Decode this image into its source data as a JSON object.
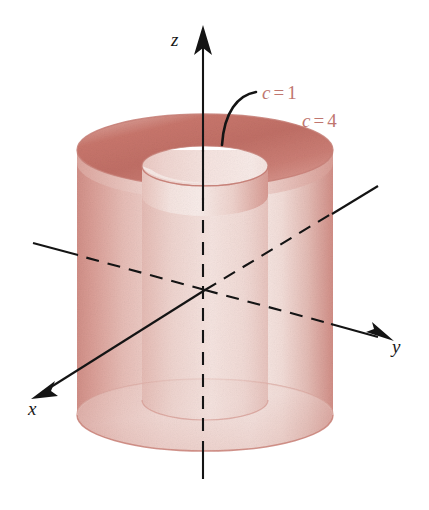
{
  "figure": {
    "background_color": "#ffffff",
    "width": 429,
    "height": 510
  },
  "axes": {
    "z": {
      "label": "z",
      "label_x": 171,
      "label_y": 30,
      "arrow": "up",
      "color": "#141414"
    },
    "y": {
      "label": "y",
      "label_x": 392,
      "label_y": 337,
      "arrow": "right-down",
      "color": "#141414"
    },
    "x": {
      "label": "x",
      "label_x": 28,
      "label_y": 399,
      "arrow": "left-down",
      "color": "#141414"
    }
  },
  "annotations": [
    {
      "name": "inner-cylinder-label",
      "c": "c",
      "eq": "=",
      "value": "1",
      "text": "c = 1",
      "x": 262,
      "y": 83,
      "color": "#c0766f",
      "leader": "curved-arc"
    },
    {
      "name": "outer-cylinder-label",
      "c": "c",
      "eq": "=",
      "value": "4",
      "text": "c = 4",
      "x": 302,
      "y": 111,
      "color": "#c0766f",
      "leader": "none"
    }
  ],
  "surfaces": {
    "outer_cylinder": {
      "name": "outer-cylinder",
      "c_value": "4",
      "center_x": 205,
      "top_y": 150,
      "bottom_y": 415,
      "radius_x": 128,
      "radius_y": 36,
      "fill_light": "#f3e0dc",
      "fill_mid": "#e6bfb9",
      "fill_dark": "#d79a92",
      "rim_dark": "#c2736b"
    },
    "inner_cylinder": {
      "name": "inner-cylinder",
      "c_value": "1",
      "center_x": 205,
      "top_y": 166,
      "bottom_y": 400,
      "radius_x": 63,
      "radius_y": 20,
      "fill_light": "#f6e8e4",
      "fill_mid": "#e9c8c2",
      "fill_dark": "#d8a098"
    }
  },
  "colors": {
    "rose_light": "#f5e4e0",
    "rose_mid": "#e3bcb5",
    "rose_dark": "#c8827a",
    "rose_deep": "#bc6a61",
    "label_rose": "#c0766f",
    "ink": "#141414",
    "paper": "#ffffff"
  }
}
